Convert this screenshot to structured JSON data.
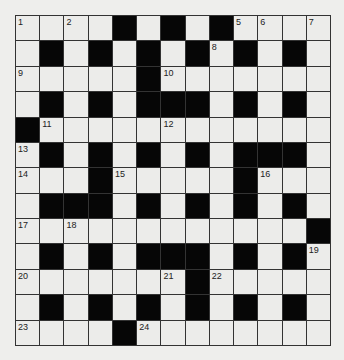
{
  "puzzle": {
    "rows": 13,
    "cols": 13,
    "colors": {
      "white": "#ececea",
      "black": "#060606",
      "line": "#333333",
      "background": "#eeeeec"
    },
    "grid": [
      "....#.#.#....",
      ".#.#.#.#.#.#.",
      ".....#.......",
      ".#.#.###.#.#.",
      "#............",
      ".#.#.#.#.###.",
      "...#.....#...",
      ".###.#.#.#.#.",
      "............#",
      ".#.#.###.#.#.",
      ".......#.....",
      ".#.#.#.#.#.#.",
      "....#........"
    ],
    "numbers": [
      {
        "r": 0,
        "c": 0,
        "n": "1"
      },
      {
        "r": 0,
        "c": 2,
        "n": "2"
      },
      {
        "r": 0,
        "c": 4,
        "n": "3"
      },
      {
        "r": 0,
        "c": 6,
        "n": "4"
      },
      {
        "r": 0,
        "c": 9,
        "n": "5"
      },
      {
        "r": 0,
        "c": 10,
        "n": "6"
      },
      {
        "r": 0,
        "c": 12,
        "n": "7"
      },
      {
        "r": 1,
        "c": 8,
        "n": "8"
      },
      {
        "r": 2,
        "c": 0,
        "n": "9"
      },
      {
        "r": 2,
        "c": 6,
        "n": "10"
      },
      {
        "r": 4,
        "c": 1,
        "n": "11"
      },
      {
        "r": 4,
        "c": 6,
        "n": "12"
      },
      {
        "r": 5,
        "c": 0,
        "n": "13"
      },
      {
        "r": 6,
        "c": 0,
        "n": "14"
      },
      {
        "r": 6,
        "c": 4,
        "n": "15"
      },
      {
        "r": 6,
        "c": 10,
        "n": "16"
      },
      {
        "r": 8,
        "c": 0,
        "n": "17"
      },
      {
        "r": 8,
        "c": 2,
        "n": "18"
      },
      {
        "r": 9,
        "c": 12,
        "n": "19"
      },
      {
        "r": 10,
        "c": 0,
        "n": "20"
      },
      {
        "r": 10,
        "c": 6,
        "n": "21"
      },
      {
        "r": 10,
        "c": 8,
        "n": "22"
      },
      {
        "r": 12,
        "c": 0,
        "n": "23"
      },
      {
        "r": 12,
        "c": 5,
        "n": "24"
      }
    ]
  }
}
